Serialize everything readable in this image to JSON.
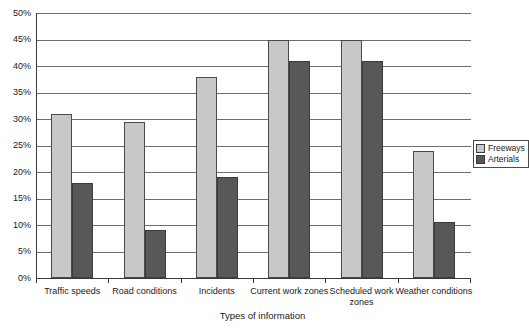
{
  "chart_data": {
    "type": "bar",
    "title": "",
    "xlabel": "Types of information",
    "ylabel": "",
    "ylim": [
      0,
      50
    ],
    "ytick_labels": [
      "50%",
      "45%",
      "40%",
      "35%",
      "30%",
      "25%",
      "20%",
      "15%",
      "10%",
      "5%",
      "0%"
    ],
    "ytick_values": [
      50,
      45,
      40,
      35,
      30,
      25,
      20,
      15,
      10,
      5,
      0
    ],
    "grid": true,
    "legend_position": "right",
    "categories": [
      "Traffic speeds",
      "Road conditions",
      "Incidents",
      "Current work zones",
      "Scheduled work zones",
      "Weather conditions"
    ],
    "series": [
      {
        "name": "Freeways",
        "color": "#c8c8c8",
        "values": [
          31,
          29.5,
          38,
          45,
          45,
          24
        ]
      },
      {
        "name": "Arterials",
        "color": "#585858",
        "values": [
          18,
          9,
          19,
          41,
          41,
          10.5
        ]
      }
    ]
  },
  "legend": {
    "entries": [
      {
        "label": "Freeways"
      },
      {
        "label": "Arterials"
      }
    ]
  }
}
